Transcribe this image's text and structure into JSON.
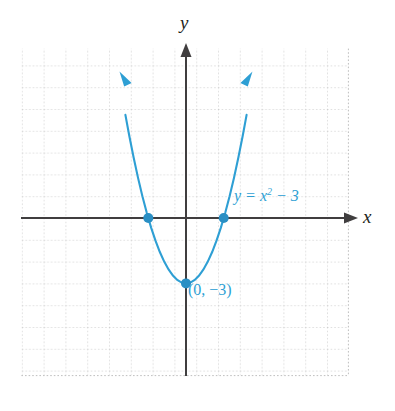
{
  "figure": {
    "title": "",
    "axis_labels": {
      "x": "x",
      "y": "y"
    },
    "annotations": {
      "equation_prefix": "y = x",
      "equation_exponent": "2",
      "equation_suffix": " − 3",
      "equation_full": "y = x² − 3",
      "vertex_point": "(0, −3)"
    },
    "colors": {
      "curve": "#2e9fd4",
      "point": "#2a8fc4",
      "axis": "#403e3f",
      "grid": "#c9c9c9",
      "label_text": "#231f20",
      "background": "#ffffff"
    }
  },
  "chart_data": {
    "type": "line",
    "title": "",
    "xlabel": "x",
    "ylabel": "y",
    "equation": "y = x^2 - 3",
    "xlim": [
      -7.5,
      7.5
    ],
    "ylim": [
      -7.8,
      7.7
    ],
    "grid": true,
    "grid_step": 1,
    "legend": "none",
    "series": [
      {
        "name": "y = x² − 3",
        "x": [
          -2.78,
          -2.6,
          -2.4,
          -2.2,
          -2.0,
          -1.8,
          -1.6,
          -1.4,
          -1.2,
          -1.0,
          -0.8,
          -0.6,
          -0.4,
          -0.2,
          0.0,
          0.2,
          0.4,
          0.6,
          0.8,
          1.0,
          1.2,
          1.4,
          1.6,
          1.8,
          2.0,
          2.2,
          2.4,
          2.6,
          2.78
        ],
        "y": [
          4.73,
          3.76,
          2.76,
          1.84,
          1.0,
          0.24,
          -0.44,
          -1.04,
          -1.56,
          -2.0,
          -2.36,
          -2.64,
          -2.84,
          -2.96,
          -3.0,
          -2.96,
          -2.84,
          -2.64,
          -2.36,
          -2.0,
          -1.56,
          -1.04,
          -0.44,
          0.24,
          1.0,
          1.84,
          2.76,
          3.76,
          4.73
        ]
      }
    ],
    "marked_points": [
      {
        "label": "",
        "x": -1.73,
        "y": 0
      },
      {
        "label": "",
        "x": 1.73,
        "y": 0
      },
      {
        "label": "(0, −3)",
        "x": 0,
        "y": -3
      }
    ],
    "annotations": [
      {
        "text": "y = x² − 3",
        "x": 2.2,
        "y": 0.95
      },
      {
        "text": "(0, −3)",
        "x": 0.1,
        "y": -3.8
      }
    ]
  }
}
